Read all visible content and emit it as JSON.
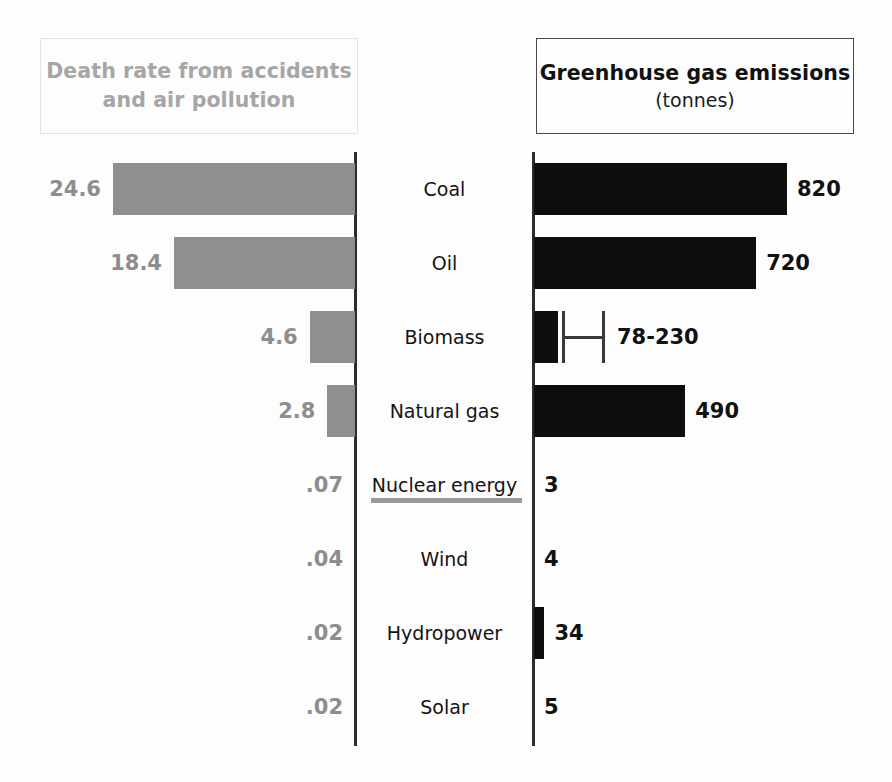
{
  "header": {
    "left": {
      "line1": "Death rate from accidents",
      "line2": "and air pollution"
    },
    "right": {
      "title": "Greenhouse gas emissions",
      "subtitle": "(tonnes)"
    }
  },
  "chart_data": {
    "type": "bar",
    "layout": "diverging-bidirectional-bar",
    "categories": [
      "Coal",
      "Oil",
      "Biomass",
      "Natural gas",
      "Nuclear energy",
      "Wind",
      "Hydropower",
      "Solar"
    ],
    "series": [
      {
        "name": "Death rate from accidents and air pollution",
        "side": "left",
        "direction": "leftward",
        "color": "#8f8f8f",
        "values": [
          24.6,
          18.4,
          4.6,
          2.8,
          0.07,
          0.04,
          0.02,
          0.02
        ],
        "labels": [
          "24.6",
          "18.4",
          "4.6",
          "2.8",
          ".07",
          ".04",
          ".02",
          ".02"
        ],
        "axis_max": 26
      },
      {
        "name": "Greenhouse gas emissions (tonnes)",
        "side": "right",
        "direction": "rightward",
        "color": "#0d0d0d",
        "values": [
          820,
          720,
          78,
          490,
          3,
          4,
          34,
          5
        ],
        "labels": [
          "820",
          "720",
          "78-230",
          "490",
          "3",
          "4",
          "34",
          "5"
        ],
        "ranges": [
          null,
          null,
          [
            78,
            230
          ],
          null,
          null,
          null,
          null,
          null
        ],
        "axis_max": 820
      }
    ],
    "xlabel": "",
    "ylabel": "",
    "grid": false,
    "legend": "none"
  },
  "rows": [
    {
      "category": "Coal",
      "left_label": "24.6",
      "left_value": 24.6,
      "right_label": "820",
      "right_value": 820,
      "has_range": false
    },
    {
      "category": "Oil",
      "left_label": "18.4",
      "left_value": 18.4,
      "right_label": "720",
      "right_value": 720,
      "has_range": false
    },
    {
      "category": "Biomass",
      "left_label": "4.6",
      "left_value": 4.6,
      "right_label": "78-230",
      "right_value": 78,
      "range_low": 78,
      "range_high": 230,
      "has_range": true
    },
    {
      "category": "Natural gas",
      "left_label": "2.8",
      "left_value": 2.8,
      "right_label": "490",
      "right_value": 490,
      "has_range": false
    },
    {
      "category": "Nuclear energy",
      "left_label": ".07",
      "left_value": 0.07,
      "right_label": "3",
      "right_value": 3,
      "has_range": false
    },
    {
      "category": "Wind",
      "left_label": ".04",
      "left_value": 0.04,
      "right_label": "4",
      "right_value": 4,
      "has_range": false
    },
    {
      "category": "Hydropower",
      "left_label": ".02",
      "left_value": 0.02,
      "right_label": "34",
      "right_value": 34,
      "has_range": false
    },
    {
      "category": "Solar",
      "left_label": ".02",
      "left_value": 0.02,
      "right_label": "5",
      "right_value": 5,
      "has_range": false
    }
  ],
  "colors": {
    "left_bar": "#8f8f8f",
    "right_bar": "#0d0d0d",
    "left_header_text": "#a6a6a6",
    "right_header_text": "#111111",
    "axis": "#2c2c2c",
    "background": "#fdfdfd"
  }
}
